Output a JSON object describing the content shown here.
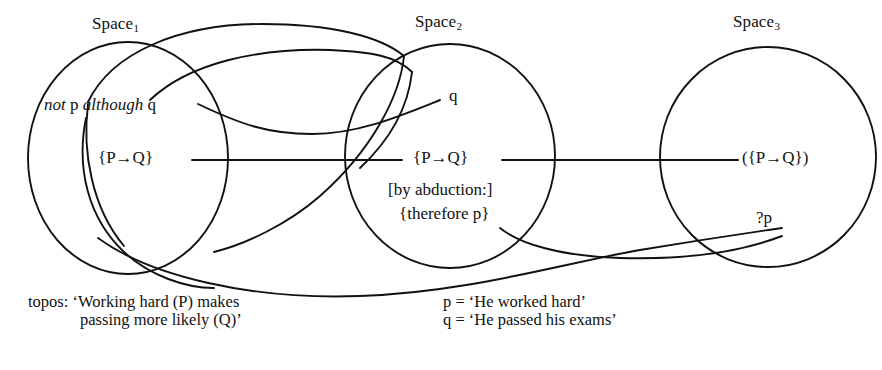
{
  "figure": {
    "type": "mental-spaces-diagram",
    "background_color": "#ffffff",
    "ink_color": "#111111"
  },
  "spaces": [
    {
      "id": "space1",
      "label": "Space",
      "subscript": "1"
    },
    {
      "id": "space2",
      "label": "Space",
      "subscript": "2"
    },
    {
      "id": "space3",
      "label": "Space",
      "subscript": "3"
    }
  ],
  "nodes": {
    "space1_utterance": {
      "pre_italic": "not",
      "roman_1": " p ",
      "post_italic": "although",
      "roman_2": " q"
    },
    "space1_topos": "{P→Q}",
    "space2_q": "q",
    "space2_topos": "{P→Q}",
    "space2_abduction_line1": "[by abduction:]",
    "space2_abduction_line2": "{therefore p}",
    "space3_topos": "({P→Q})",
    "space3_query": "?p"
  },
  "captions": {
    "topos_line1": "topos: ‘Working hard (P) makes",
    "topos_line2": "passing more likely (Q)’",
    "legend_p": "p = ‘He worked hard’",
    "legend_q": "q = ‘He passed his exams’"
  }
}
